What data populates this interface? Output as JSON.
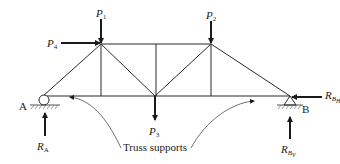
{
  "diagram": {
    "type": "truss",
    "colors": {
      "line": "#2a2a2a",
      "text": "#1a1a1a",
      "background": "#ffffff"
    },
    "supports": {
      "A": {
        "label": "A",
        "kind": "roller"
      },
      "B": {
        "label": "B",
        "kind": "pin"
      }
    },
    "loads": {
      "P1": {
        "main": "P",
        "sub": "1",
        "direction": "down"
      },
      "P2": {
        "main": "P",
        "sub": "2",
        "direction": "down"
      },
      "P3": {
        "main": "P",
        "sub": "3",
        "direction": "down"
      },
      "P4": {
        "main": "P",
        "sub": "4",
        "direction": "right"
      }
    },
    "reactions": {
      "RA": {
        "main": "R",
        "sub": "A",
        "direction": "up"
      },
      "RBH": {
        "main": "R",
        "sub": "B",
        "subsub": "H",
        "direction": "left"
      },
      "RBV": {
        "main": "R",
        "sub": "B",
        "subsub": "V",
        "direction": "up"
      }
    },
    "callout": {
      "text": "Truss supports"
    }
  }
}
